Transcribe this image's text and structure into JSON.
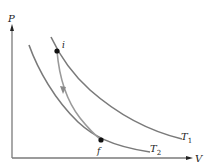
{
  "diagram": {
    "type": "PV diagram",
    "axes": {
      "y_label": "P",
      "x_label": "V"
    },
    "isotherms": [
      {
        "label": "T",
        "subscript": "1",
        "name": "higher-temperature isotherm"
      },
      {
        "label": "T",
        "subscript": "2",
        "name": "lower-temperature isotherm"
      }
    ],
    "points": {
      "initial": "i",
      "final": "f"
    },
    "process": "adiabatic path from i to f",
    "colors": {
      "curve": "#7a7a7a",
      "axis": "#7a7a7a",
      "process": "#9a9a9a",
      "point": "#111111"
    }
  }
}
